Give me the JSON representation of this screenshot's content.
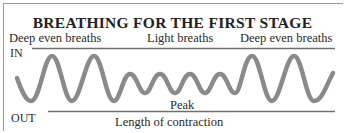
{
  "title": "BREATHING FOR THE FIRST STAGE",
  "phases": [
    {
      "label": "Deep even breaths"
    },
    {
      "label": "Light breaths"
    },
    {
      "label": "Deep even breaths"
    }
  ],
  "axis": {
    "in_label": "IN",
    "out_label": "OUT",
    "peak_label": "Peak",
    "x_label": "Length of contraction"
  },
  "colors": {
    "wave": "#8a8a8a",
    "lines": "#6f6f6f",
    "text": "#2a2a2a"
  }
}
